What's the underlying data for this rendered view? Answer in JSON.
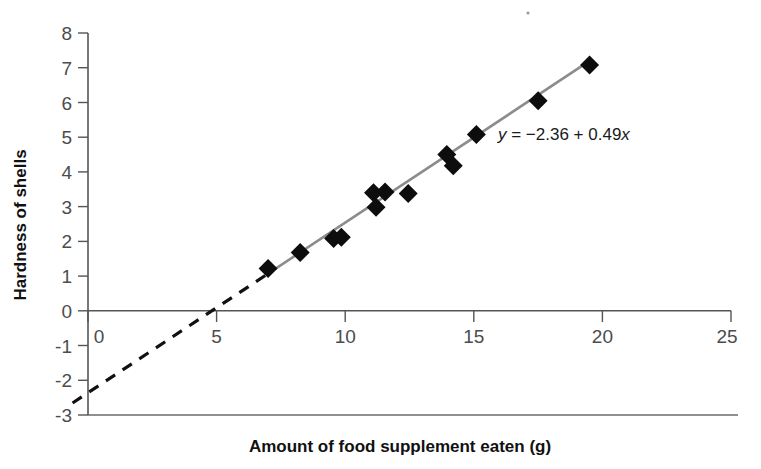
{
  "chart_data": {
    "type": "scatter",
    "title": "",
    "xlabel": "Amount of food supplement eaten (g)",
    "ylabel": "Hardness of shells",
    "xlim": [
      0,
      25
    ],
    "ylim": [
      -3,
      8
    ],
    "xticks": [
      0,
      5,
      10,
      15,
      20,
      25
    ],
    "yticks": [
      8,
      7,
      6,
      5,
      4,
      3,
      2,
      1,
      0,
      -1,
      -2,
      -3
    ],
    "xtick_labels": [
      "0",
      "5",
      "10",
      "15",
      "20",
      "25"
    ],
    "ytick_labels": [
      "8",
      "7",
      "6",
      "5",
      "4",
      "3",
      "2",
      "1",
      "0",
      "-1",
      "-2",
      "-3"
    ],
    "grid": false,
    "legend": false,
    "points": [
      {
        "x": 7.0,
        "y": 1.22
      },
      {
        "x": 8.25,
        "y": 1.68
      },
      {
        "x": 9.55,
        "y": 2.08
      },
      {
        "x": 9.85,
        "y": 2.12
      },
      {
        "x": 11.1,
        "y": 3.4
      },
      {
        "x": 11.2,
        "y": 2.98
      },
      {
        "x": 11.55,
        "y": 3.42
      },
      {
        "x": 12.45,
        "y": 3.38
      },
      {
        "x": 13.95,
        "y": 4.5
      },
      {
        "x": 14.2,
        "y": 4.18
      },
      {
        "x": 15.1,
        "y": 5.08
      },
      {
        "x": 17.5,
        "y": 6.05
      },
      {
        "x": 19.5,
        "y": 7.08
      }
    ],
    "fit_line": {
      "equation_text": "y = -2.36 + 0.49x",
      "equation_y_symbol": "y",
      "equation_rest": " = −2.36 + 0.49",
      "equation_x_symbol": "x",
      "intercept": -2.36,
      "slope": 0.49,
      "x_root": 4.82,
      "solid_segment_x": [
        7.0,
        19.5
      ],
      "dashed_segment_x": [
        -0.6,
        7.0
      ],
      "solid_color": "#8c8c8c",
      "dashed_color": "#111111"
    },
    "annotations": [
      {
        "text": "y = -2.36 + 0.49x",
        "x": 15.6,
        "y": 4.95
      }
    ],
    "marker_style": "filled-diamond",
    "marker_color": "#0d0d0d"
  },
  "axes": {
    "x_title": "Amount of food supplement eaten (g)",
    "y_title": "Hardness of shells"
  },
  "colors": {
    "background": "#ffffff",
    "axis": "#555555",
    "tick_label": "#4c4c4c",
    "marker": "#0d0d0d",
    "regression_solid": "#8c8c8c",
    "regression_dashed": "#111111"
  }
}
